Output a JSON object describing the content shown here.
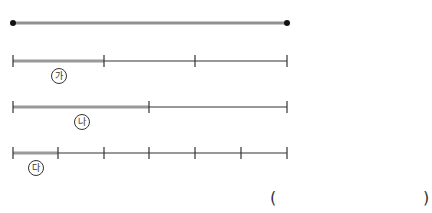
{
  "diagram": {
    "reference_line": {
      "x1": 13,
      "x2": 287,
      "y": 23,
      "color": "#909090"
    },
    "bars": [
      {
        "label": "가",
        "y": 61,
        "ticks": [
          13,
          104,
          195,
          287
        ],
        "highlight_end": 104,
        "label_x": 51,
        "label_y": 68
      },
      {
        "label": "나",
        "y": 107,
        "ticks": [
          13,
          149,
          287
        ],
        "highlight_end": 149,
        "label_x": 74,
        "label_y": 114
      },
      {
        "label": "다",
        "y": 153,
        "ticks": [
          13,
          58,
          104,
          149,
          195,
          241,
          287
        ],
        "highlight_end": 58,
        "label_x": 28,
        "label_y": 160
      }
    ],
    "colors": {
      "line": "#333333",
      "highlight": "#999999"
    }
  },
  "answer": {
    "open_paren": "(",
    "close_paren": ")"
  }
}
